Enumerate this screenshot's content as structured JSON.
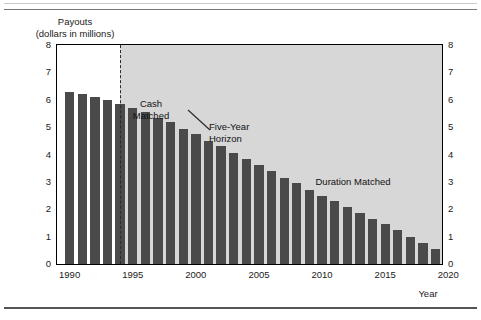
{
  "axes": {
    "y_title": "Payouts\n(dollars in millions)",
    "x_title": "Year",
    "y_ticks": [
      "0",
      "1",
      "2",
      "3",
      "4",
      "5",
      "6",
      "7",
      "8"
    ],
    "x_ticks": [
      "1990",
      "1995",
      "2000",
      "2005",
      "2010",
      "2015",
      "2020"
    ]
  },
  "annotations": {
    "cash_matched": "Cash\nMatched",
    "five_year_horizon": "Five-Year\nHorizon",
    "duration_matched": "Duration Matched"
  },
  "colors": {
    "bar": "#4a4a4a",
    "shaded_region": "#d7d7d7",
    "unshaded_region": "#ffffff",
    "frame": "#000000",
    "divider": "#2b2b2b"
  },
  "chart_data": {
    "type": "bar",
    "title": "",
    "xlabel": "Year",
    "ylabel": "Payouts (dollars in millions)",
    "ylim": [
      0,
      8
    ],
    "xlim": [
      1989.5,
      2020
    ],
    "grid": false,
    "legend": "none",
    "y_tick_values": [
      0,
      1,
      2,
      3,
      4,
      5,
      6,
      7,
      8
    ],
    "x_tick_values": [
      1990,
      1995,
      2000,
      2005,
      2010,
      2015,
      2020
    ],
    "dual_y_axis": true,
    "categories": [
      1990,
      1991,
      1992,
      1993,
      1994,
      1995,
      1996,
      1997,
      1998,
      1999,
      2000,
      2001,
      2002,
      2003,
      2004,
      2005,
      2006,
      2007,
      2008,
      2009,
      2010,
      2011,
      2012,
      2013,
      2014,
      2015,
      2016,
      2017,
      2018,
      2019
    ],
    "values": [
      6.3,
      6.2,
      6.1,
      6.0,
      5.85,
      5.7,
      5.55,
      5.35,
      5.2,
      4.95,
      4.75,
      4.5,
      4.3,
      4.05,
      3.85,
      3.6,
      3.4,
      3.15,
      2.95,
      2.7,
      2.5,
      2.3,
      2.1,
      1.85,
      1.65,
      1.45,
      1.25,
      1.0,
      0.75,
      0.55
    ],
    "regions": [
      {
        "label": "Cash Matched",
        "start": 1989.5,
        "end": 1994.5,
        "shaded": false
      },
      {
        "label": "Duration Matched",
        "start": 1994.5,
        "end": 2020,
        "shaded": true
      }
    ],
    "vlines": [
      {
        "x": 1994.5,
        "style": "dashed",
        "label": "Five-Year Horizon"
      }
    ]
  }
}
